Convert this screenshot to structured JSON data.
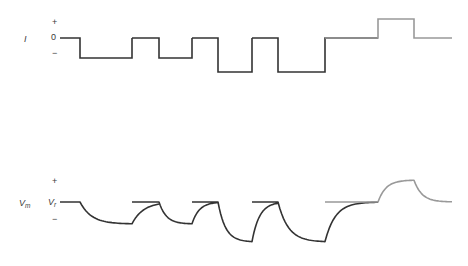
{
  "figure": {
    "background_color": "#ffffff",
    "trace_color_primary": "#333333",
    "trace_color_secondary": "#999999",
    "stroke_width": 1.6
  },
  "panels": {
    "current": {
      "axis_label": "I",
      "plus_sign": "+",
      "zero_label": "0",
      "minus_sign": "−",
      "baseline_y": 38
    },
    "voltage": {
      "axis_label_symbol": "V",
      "axis_label_subscript": "m",
      "baseline_label_symbol": "V",
      "baseline_label_subscript": "r",
      "plus_sign": "+",
      "minus_sign": "−",
      "baseline_y": 202
    }
  },
  "chart_data": {
    "type": "line",
    "xlabel": "",
    "ylabel": "",
    "grid": false,
    "legend": false,
    "x_range": [
      60,
      452
    ],
    "panels": [
      {
        "name": "current",
        "ylabel": "I",
        "y_baseline_px": 38,
        "y_axis_ticks": [
          "+",
          "0",
          "−"
        ],
        "series": [
          {
            "name": "hyperpolarizing-and-depolarizing-current-steps",
            "color": "#333333",
            "description": "Square current pulses: four hyperpolarizing steps of progressively larger amplitude followed by one depolarizing step",
            "steps": [
              {
                "index": 1,
                "polarity": "negative",
                "amplitude_px": 20,
                "start_x": 80,
                "end_x": 132,
                "color": "#333333"
              },
              {
                "index": 2,
                "polarity": "negative",
                "amplitude_px": 20,
                "start_x": 159,
                "end_x": 192,
                "color": "#333333"
              },
              {
                "index": 3,
                "polarity": "negative",
                "amplitude_px": 34,
                "start_x": 218,
                "end_x": 252,
                "color": "#333333"
              },
              {
                "index": 4,
                "polarity": "negative",
                "amplitude_px": 34,
                "start_x": 278,
                "end_x": 325,
                "color": "#333333"
              },
              {
                "index": 5,
                "polarity": "positive",
                "amplitude_px": 19,
                "start_x": 378,
                "end_x": 414,
                "color": "#999999"
              }
            ]
          }
        ]
      },
      {
        "name": "voltage",
        "ylabel": "Vm",
        "y_baseline_px": 202,
        "y_axis_ticks": [
          "+",
          "Vr",
          "−"
        ],
        "series": [
          {
            "name": "membrane-potential-response",
            "color": "#333333",
            "description": "Exponential charging and discharging membrane potential responses to each current step; the final depolarizing response is drawn in gray",
            "responses": [
              {
                "index": 1,
                "polarity": "hyperpolarizing",
                "amplitude_px": 22,
                "start_x": 80,
                "end_x": 132,
                "color": "#333333"
              },
              {
                "index": 2,
                "polarity": "hyperpolarizing",
                "amplitude_px": 22,
                "start_x": 159,
                "end_x": 192,
                "color": "#333333"
              },
              {
                "index": 3,
                "polarity": "hyperpolarizing",
                "amplitude_px": 40,
                "start_x": 218,
                "end_x": 252,
                "color": "#333333"
              },
              {
                "index": 4,
                "polarity": "hyperpolarizing",
                "amplitude_px": 40,
                "start_x": 278,
                "end_x": 325,
                "color": "#333333"
              },
              {
                "index": 5,
                "polarity": "depolarizing",
                "amplitude_px": 22,
                "start_x": 378,
                "end_x": 414,
                "color": "#999999"
              }
            ]
          }
        ]
      }
    ]
  }
}
